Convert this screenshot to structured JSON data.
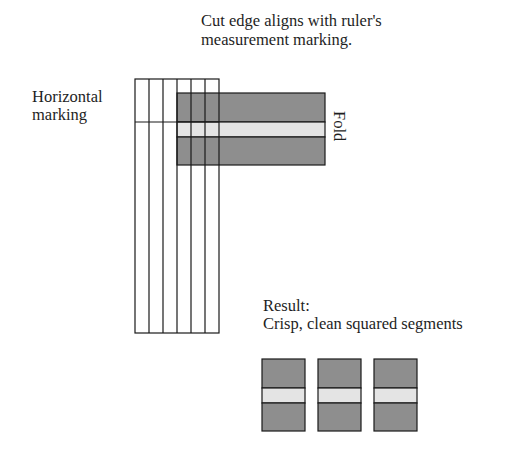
{
  "labels": {
    "cut_edge_line1": "Cut edge aligns with ruler's",
    "cut_edge_line2": "measurement marking.",
    "horizontal_line1": "Horizontal",
    "horizontal_line2": "marking",
    "fold": "Fold",
    "result_line1": "Result:",
    "result_line2": "Crisp, clean squared segments"
  },
  "colors": {
    "strip_dark": "#8e8e8e",
    "fold_band": "#e4e4e4",
    "line": "#1a1a1a"
  },
  "ruler": {
    "columns": 6,
    "x": 135,
    "y": 79,
    "column_width": 14,
    "height": 254,
    "horizontal_marking_y": 122
  },
  "strip": {
    "x": 177,
    "y": 93,
    "width": 148,
    "height": 72,
    "fold_top": 122,
    "fold_bottom": 137
  },
  "result_segments": [
    {
      "x": 262,
      "y": 359,
      "width": 43,
      "height": 72
    },
    {
      "x": 318,
      "y": 359,
      "width": 43,
      "height": 72
    },
    {
      "x": 374,
      "y": 359,
      "width": 43,
      "height": 72
    }
  ]
}
